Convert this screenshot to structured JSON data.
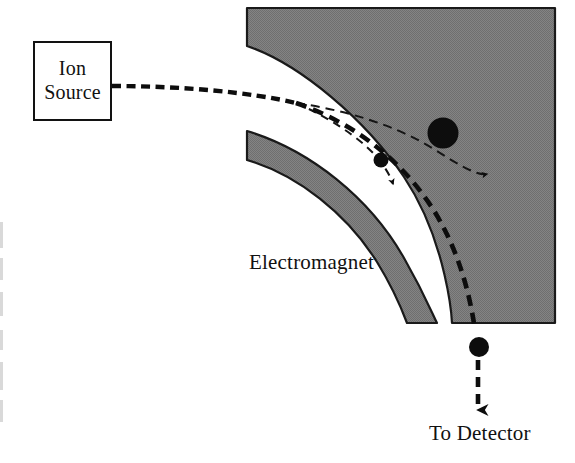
{
  "figure": {
    "width": 575,
    "height": 463,
    "background_color": "#ffffff",
    "ink_color": "#111111",
    "magnet_fill_color": "#808080",
    "magnet_stroke_color": "#1a1a1a"
  },
  "labels": {
    "ion_source_line1": "Ion",
    "ion_source_line2": "Source",
    "electromagnet": "Electromagnet",
    "to_detector": "To Detector"
  },
  "components": {
    "ion_source": {
      "name": "Ion Source",
      "shape": "rectangle",
      "x": 33,
      "y": 41,
      "width": 79,
      "height": 80
    },
    "electromagnet_outer": {
      "name": "Electromagnet outer pole",
      "shape": "quarter-annulus-corner",
      "fill": "#808080"
    },
    "electromagnet_inner": {
      "name": "Electromagnet inner pole band",
      "shape": "arc-band",
      "fill": "#808080"
    }
  },
  "trajectories": [
    {
      "id": "beam-entry",
      "name": "incoming ion beam",
      "style": "thick-dashed",
      "description": "horizontal dashed beam from ion source into magnet gap"
    },
    {
      "id": "light-ion-path",
      "name": "light ion trajectory (smallest mass, tightest curve)",
      "style": "thin-dashed",
      "ion_marker": "small-circle",
      "arrowhead": true
    },
    {
      "id": "medium-ion-path",
      "name": "selected ion trajectory to detector",
      "style": "thick-dashed",
      "ion_marker": "medium-circle",
      "arrowhead": true
    },
    {
      "id": "heavy-ion-path",
      "name": "heavy ion trajectory (largest mass, widest curve)",
      "style": "thin-dashed",
      "ion_marker": "large-circle",
      "arrowhead": true
    }
  ],
  "ion_markers": [
    {
      "id": "small-ion",
      "cx": 381,
      "cy": 160,
      "r": 7.5,
      "fill": "#0d0d0d"
    },
    {
      "id": "large-ion",
      "cx": 443,
      "cy": 133,
      "r": 15.5,
      "fill": "#0d0d0d"
    },
    {
      "id": "detected-ion",
      "cx": 479,
      "cy": 347,
      "r": 10.0,
      "fill": "#0d0d0d"
    }
  ]
}
